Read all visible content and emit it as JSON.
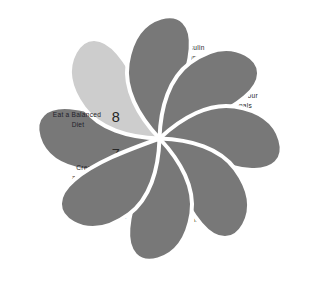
{
  "diagram": {
    "type": "pinwheel-petal-diagram",
    "background_color": "#ffffff",
    "petal_color_default": "#787878",
    "petal_color_highlight": "#cdcdcd",
    "petal_outline_color": "#ffffff",
    "number_color": "#262626",
    "label_color": "#1f1f2b",
    "petal_count": 8,
    "petals": [
      {
        "number": "1",
        "label_lines": [
          "Address",
          "Inflammation"
        ],
        "color": "#787878",
        "highlighted": false
      },
      {
        "number": "2",
        "label_lines": [
          "Treat Insulin",
          "Resistance"
        ],
        "color": "#cdcdcd",
        "highlighted": true
      },
      {
        "number": "3",
        "label_lines": [
          "Balance Your",
          "Adrenals"
        ],
        "color": "#787878",
        "highlighted": false
      },
      {
        "number": "4",
        "label_lines": [
          "Treat Excess",
          "Androgens"
        ],
        "color": "#787878",
        "highlighted": false
      },
      {
        "number": "5",
        "label_lines": [
          "Address",
          "Hormonal",
          "Imbalances"
        ],
        "color": "#787878",
        "highlighted": false
      },
      {
        "number": "6",
        "label_lines": [
          "Balance",
          "Your Thyroid"
        ],
        "color": "#787878",
        "highlighted": false
      },
      {
        "number": "7",
        "label_lines": [
          "Create",
          "a Healthy",
          "Environment"
        ],
        "color": "#787878",
        "highlighted": false
      },
      {
        "number": "8",
        "label_lines": [
          "Eat a Balanced",
          "Diet"
        ],
        "color": "#787878",
        "highlighted": false
      }
    ]
  }
}
